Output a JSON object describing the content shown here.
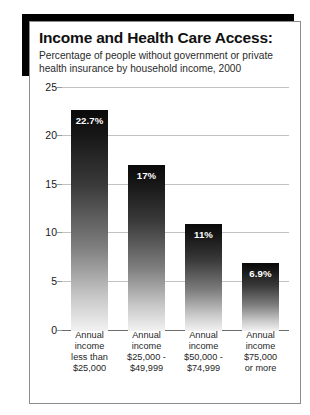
{
  "chart_data": {
    "type": "bar",
    "title": "Income and Health Care Access:",
    "subtitle": "Percentage of people without government or private health insurance by household income, 2000",
    "categories": [
      "Annual income less than $25,000",
      "Annual income $25,000 - $49,999",
      "Annual income $50,000 - $74,999",
      "Annual income $75,000 or more"
    ],
    "category_lines": [
      [
        "Annual",
        "income",
        "less than",
        "$25,000"
      ],
      [
        "Annual",
        "income",
        "$25,000 -",
        "$49,999"
      ],
      [
        "Annual",
        "income",
        "$50,000 -",
        "$74,999"
      ],
      [
        "Annual",
        "income",
        "$75,000",
        "or more"
      ]
    ],
    "values": [
      22.7,
      17,
      11,
      6.9
    ],
    "data_labels": [
      "22.7%",
      "17%",
      "11%",
      "6.9%"
    ],
    "xlabel": "",
    "ylabel": "",
    "ylim": [
      0,
      25
    ],
    "yticks": [
      0,
      5,
      10,
      15,
      20,
      25
    ],
    "ytick_labels": [
      "0",
      "5",
      "10",
      "15",
      "20",
      "25"
    ],
    "grid": true,
    "legend": false,
    "bar_color_top": "#0a0a0a",
    "bar_color_bottom": "#f2f2f2",
    "gridline_color": "#c2c2c2",
    "axis_color": "#6d6d6d",
    "frame_color": "#8d8d8d",
    "shadow_color": "#000000",
    "background": "#ffffff"
  }
}
